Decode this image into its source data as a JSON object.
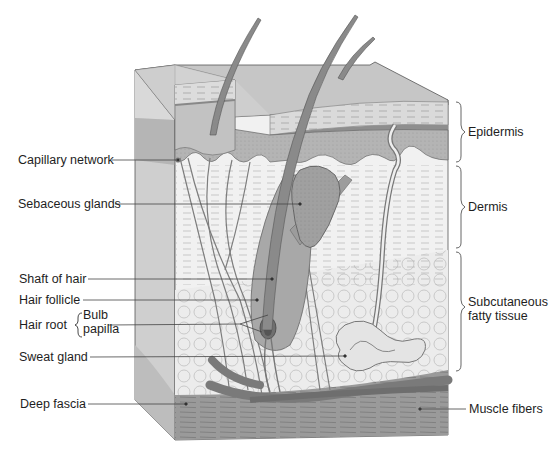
{
  "diagram": {
    "type": "skin-cross-section",
    "left_labels": [
      {
        "id": "capillary",
        "text": "Capillary network"
      },
      {
        "id": "sebaceous",
        "text": "Sebaceous glands"
      },
      {
        "id": "shaft",
        "text": "Shaft of hair"
      },
      {
        "id": "follicle",
        "text": "Hair follicle"
      },
      {
        "id": "hairroot",
        "text": "Hair root"
      },
      {
        "id": "bulb",
        "text": "Bulb"
      },
      {
        "id": "papilla",
        "text": "papilla"
      },
      {
        "id": "sweat",
        "text": "Sweat gland"
      },
      {
        "id": "fascia",
        "text": "Deep fascia"
      }
    ],
    "right_labels": [
      {
        "id": "epidermis",
        "text": "Epidermis"
      },
      {
        "id": "dermis",
        "text": "Dermis"
      },
      {
        "id": "subq1",
        "text": "Subcutaneous"
      },
      {
        "id": "subq2",
        "text": "fatty tissue"
      },
      {
        "id": "muscle",
        "text": "Muscle fibers"
      }
    ],
    "colors": {
      "outline": "#555555",
      "epidermis_fill": "#b9b9b9",
      "stratum_fill": "#d4d4d4",
      "dermis_fill": "#f1f1f1",
      "fat_fill": "#ebebeb",
      "left_face": "#c8c8c8",
      "muscle_fill": "#8f8f8f",
      "vessel_fill": "#7a7a7a",
      "hair_fill": "#8a8a8a",
      "leader_line": "#444444"
    }
  }
}
